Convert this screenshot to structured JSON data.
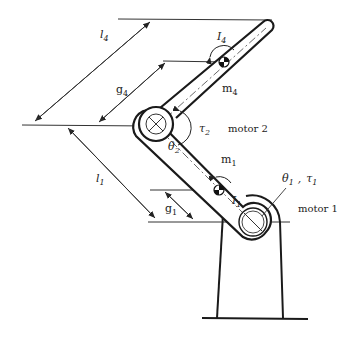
{
  "diagram": {
    "type": "two-link robot arm schematic",
    "colors": {
      "line": "#1a1a1a",
      "thin": "#333333",
      "background": "#ffffff"
    },
    "labels": {
      "l4": {
        "main": "l",
        "sub": "4"
      },
      "g4": {
        "main": "g",
        "sub": "4"
      },
      "I4": {
        "main": "I",
        "sub": "4"
      },
      "m4": {
        "main": "m",
        "sub": "4"
      },
      "tau2": {
        "main": "τ",
        "sub": "2"
      },
      "motor2": "motor 2",
      "theta2": {
        "main": "θ",
        "sub": "2"
      },
      "m1": {
        "main": "m",
        "sub": "1"
      },
      "l1": {
        "main": "l",
        "sub": "1"
      },
      "g1": {
        "main": "g",
        "sub": "1"
      },
      "I1": {
        "main": "I",
        "sub": "1"
      },
      "theta1_tau1": {
        "theta": "θ",
        "theta_sub": "1",
        "sep": ",",
        "tau": "τ",
        "tau_sub": "1"
      },
      "motor1": "motor 1"
    }
  }
}
